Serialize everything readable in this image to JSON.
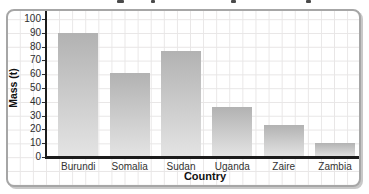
{
  "chart_data": {
    "type": "bar",
    "title": "",
    "categories": [
      "Burundi",
      "Somalia",
      "Sudan",
      "Uganda",
      "Zaire",
      "Zambia"
    ],
    "values": [
      90,
      61,
      77,
      36,
      23,
      10
    ],
    "xlabel": "Country",
    "ylabel": "Mass (t)",
    "ylim": [
      0,
      100
    ],
    "y_ticks": [
      0,
      10,
      20,
      30,
      40,
      50,
      60,
      70,
      80,
      90,
      100
    ],
    "grid": "graph-paper full-panel light grid",
    "legend": false,
    "colors": {
      "bar_gradient_top": "#b2b2b2",
      "bar_gradient_bottom": "#e4e4e4",
      "axis": "#1c1c1c",
      "gridline": "#e8e6e6",
      "panel_border": "#a6a6a6"
    }
  }
}
